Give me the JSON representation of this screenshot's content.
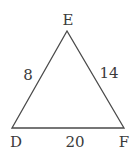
{
  "diagram": {
    "type": "triangle",
    "vertices": [
      {
        "name": "E",
        "label": "E",
        "x": 67,
        "y": 31,
        "label_x": 68,
        "label_y": 25
      },
      {
        "name": "D",
        "label": "D",
        "x": 12,
        "y": 128,
        "label_x": 16,
        "label_y": 147
      },
      {
        "name": "F",
        "label": "F",
        "x": 124,
        "y": 128,
        "label_x": 124,
        "label_y": 147
      }
    ],
    "sides": [
      {
        "from": "D",
        "to": "E",
        "length_label": "8",
        "label_x": 28,
        "label_y": 80
      },
      {
        "from": "E",
        "to": "F",
        "length_label": "14",
        "label_x": 109,
        "label_y": 78
      },
      {
        "from": "D",
        "to": "F",
        "length_label": "20",
        "label_x": 75,
        "label_y": 147
      }
    ],
    "stroke_color": "#4a4a4a",
    "label_color": "#3a3a3a",
    "background": "#ffffff"
  }
}
